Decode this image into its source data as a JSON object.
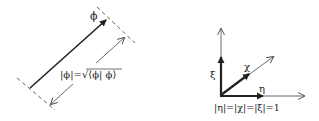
{
  "colors": {
    "background": "#ffffff",
    "ink": "#222222",
    "light_ink": "#555555"
  },
  "left_diagram": {
    "vector_label": "ϕ",
    "norm_formula": "|ϕ|=√⟨ϕ| ϕ⟩"
  },
  "right_diagram": {
    "vertical_label": "ξ",
    "diagonal_label": "χ",
    "horizontal_label": "η",
    "norm_caption": "|η|=|χ|=|ξ|=1"
  }
}
